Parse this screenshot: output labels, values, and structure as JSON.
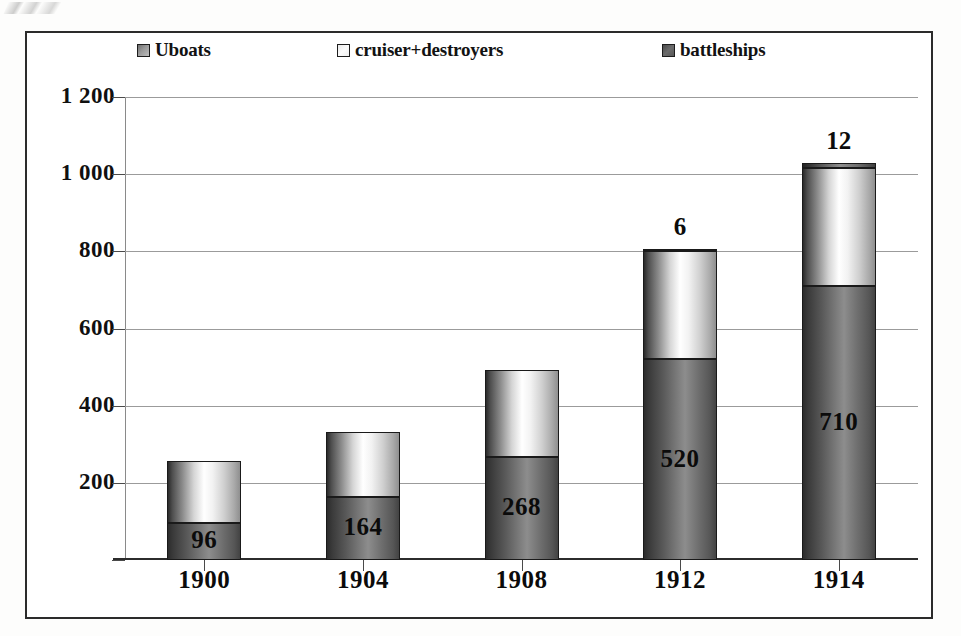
{
  "chart_data": {
    "type": "bar",
    "subtype": "stacked-column",
    "title": "",
    "xlabel": "",
    "ylabel": "",
    "categories": [
      "1900",
      "1904",
      "1908",
      "1912",
      "1914"
    ],
    "series": [
      {
        "name": "battleships",
        "color": "#6e6e6e",
        "values": [
          96,
          164,
          268,
          520,
          710
        ],
        "labels": [
          "96",
          "164",
          "268",
          "520",
          "710"
        ],
        "labels_shown": [
          true,
          true,
          true,
          true,
          true
        ]
      },
      {
        "name": "cruiser+destroyers",
        "color": "#ffffff",
        "values": [
          160,
          168,
          224,
          280,
          307
        ],
        "labels": [
          "",
          "",
          "",
          "",
          ""
        ],
        "labels_shown": [
          false,
          false,
          false,
          false,
          false
        ]
      },
      {
        "name": "Uboats",
        "color": "#8f8f8f",
        "values": [
          0,
          0,
          0,
          6,
          12
        ],
        "labels": [
          "",
          "",
          "",
          "6",
          "12"
        ],
        "labels_shown": [
          false,
          false,
          false,
          true,
          true
        ]
      }
    ],
    "totals": [
      256,
      332,
      492,
      806,
      1029
    ],
    "stack_order_bottom_to_top": [
      "battleships",
      "cruiser+destroyers",
      "Uboats"
    ],
    "ylim": [
      0,
      1200
    ],
    "ytick_values": [
      200,
      400,
      600,
      800,
      1000,
      1200
    ],
    "ytick_labels": [
      "200",
      "400",
      "600",
      "800",
      "1 000",
      "1 200"
    ],
    "grid": true,
    "grid_axis": "y",
    "legend_position": "top",
    "legend_entries": [
      "Uboats",
      "cruiser+destroyers",
      "battleships"
    ]
  },
  "legend": {
    "items": [
      {
        "label": "Uboats",
        "swatch": "uboats-swatch-icon"
      },
      {
        "label": "cruiser+destroyers",
        "swatch": "cruiser-swatch-icon"
      },
      {
        "label": "battleships",
        "swatch": "battleships-swatch-icon"
      }
    ]
  },
  "colors": {
    "frame": "#2b2b2b",
    "gridline": "#9b9b9b",
    "axis": "#2c2c2c",
    "text": "#0b0b0b",
    "battleships": "#6e6e6e",
    "cruiser_destroyers": "#ffffff",
    "uboats": "#8f8f8f",
    "background": "#ffffff"
  }
}
